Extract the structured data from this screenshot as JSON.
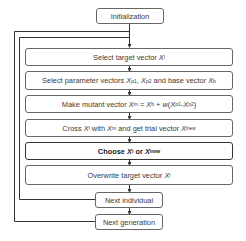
{
  "diagram": {
    "type": "flowchart",
    "nodes": [
      {
        "id": "init",
        "label": "Initialization"
      },
      {
        "id": "select_target",
        "label_pre": "Select target vector ",
        "var": "X",
        "sub": "i"
      },
      {
        "id": "select_params",
        "label": "Select parameter vectors X_p1, X_p2 and base vector X_b",
        "text": {
          "t1": "Select parameter vectors ",
          "v1": "X",
          "s1": "p1",
          "t2": ", ",
          "v2": "X",
          "s2": "p2",
          "t3": " and base vector ",
          "v3": "X",
          "s3": "b"
        }
      },
      {
        "id": "mutant",
        "label": "Make mutant vector X_m = X_b + w(X_p1-X_p2)",
        "text": {
          "t1": "Make mutant vector ",
          "v1": "X",
          "s1": "m",
          "t2": " = ",
          "v2": "X",
          "s2": "b",
          "t3": " + ",
          "w": "w",
          "t4": "(",
          "v3": "X",
          "s3": "p1",
          "t5": "-",
          "v4": "X",
          "s4": "p2",
          "t6": ")"
        }
      },
      {
        "id": "cross",
        "label": "Cross X_i with X_m and get trial vector X_i^new",
        "text": {
          "t1": "Cross ",
          "v1": "X",
          "s1": "i",
          "t2": " with ",
          "v2": "X",
          "s2": "m",
          "t3": " and get trial vector ",
          "v3": "X",
          "s3": "i",
          "sup3": "new"
        }
      },
      {
        "id": "choose",
        "label": "Choose X_i or X_i^new",
        "bold": true,
        "text": {
          "t1": "Choose ",
          "v1": "X",
          "s1": "i",
          "t2": " or ",
          "v2": "X",
          "s2": "i",
          "sup2": "new"
        }
      },
      {
        "id": "overwrite",
        "label": "Overwrite target vector X_i",
        "text": {
          "t1": "Overwrite target vector ",
          "v1": "X",
          "s1": "i"
        }
      },
      {
        "id": "next_individual",
        "label": "Next individual"
      },
      {
        "id": "next_generation",
        "label": "Next generation"
      }
    ],
    "edges": [
      [
        "init",
        "select_target"
      ],
      [
        "select_target",
        "select_params"
      ],
      [
        "select_params",
        "mutant"
      ],
      [
        "mutant",
        "cross"
      ],
      [
        "cross",
        "choose"
      ],
      [
        "choose",
        "overwrite"
      ],
      [
        "overwrite",
        "next_individual"
      ],
      [
        "next_individual",
        "next_generation"
      ],
      [
        "next_individual",
        "select_target",
        "loop-inner"
      ],
      [
        "next_generation",
        "select_target",
        "loop-outer"
      ]
    ]
  }
}
